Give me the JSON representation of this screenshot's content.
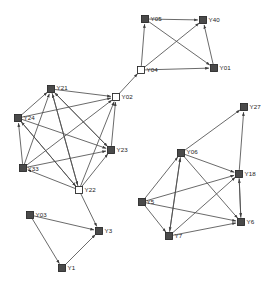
{
  "diagram": {
    "type": "directed-graph",
    "width": 275,
    "height": 287,
    "background_color": "#ffffff",
    "node_fill_color": "#4a4a4a",
    "node_hollow_color": "#ffffff",
    "node_stroke_color": "#2b2b2b",
    "edge_color": "#4f4f4f",
    "label_color": "#1a1a1a",
    "node_size": 7,
    "nodes": [
      {
        "id": "Y05",
        "label": "Y05",
        "x": 145,
        "y": 19,
        "style": "filled",
        "label_dx": 6,
        "label_dy": 2,
        "cluster": "top"
      },
      {
        "id": "Y40",
        "label": "Y40",
        "x": 203,
        "y": 20,
        "style": "filled",
        "label_dx": 6,
        "label_dy": 2,
        "cluster": "top"
      },
      {
        "id": "Y04",
        "label": "Y04",
        "x": 141,
        "y": 70,
        "style": "hollow",
        "label_dx": 6,
        "label_dy": 2,
        "cluster": "top"
      },
      {
        "id": "Y01",
        "label": "Y01",
        "x": 214,
        "y": 68,
        "style": "filled",
        "label_dx": 6,
        "label_dy": 2,
        "cluster": "top"
      },
      {
        "id": "Y21",
        "label": "Y21",
        "x": 51,
        "y": 89,
        "style": "filled",
        "label_dx": 6,
        "label_dy": 1,
        "cluster": "left"
      },
      {
        "id": "Y02",
        "label": "Y02",
        "x": 116,
        "y": 97,
        "style": "hollow",
        "label_dx": 6,
        "label_dy": 2,
        "cluster": "left"
      },
      {
        "id": "Y24",
        "label": "Y24",
        "x": 18,
        "y": 118,
        "style": "filled",
        "label_dx": 6,
        "label_dy": 2,
        "cluster": "left"
      },
      {
        "id": "Y23",
        "label": "Y23",
        "x": 111,
        "y": 150,
        "style": "filled",
        "label_dx": 6,
        "label_dy": 2,
        "cluster": "left"
      },
      {
        "id": "Y33",
        "label": "Y33",
        "x": 23,
        "y": 168,
        "style": "filled",
        "label_dx": 5,
        "label_dy": 3,
        "cluster": "left"
      },
      {
        "id": "Y22",
        "label": "Y22",
        "x": 79,
        "y": 190,
        "style": "hollow",
        "label_dx": 6,
        "label_dy": 2,
        "cluster": "left"
      },
      {
        "id": "Y03",
        "label": "Y03",
        "x": 30,
        "y": 215,
        "style": "filled",
        "label_dx": 6,
        "label_dy": 2,
        "cluster": "bottom"
      },
      {
        "id": "Y3",
        "label": "Y3",
        "x": 99,
        "y": 231,
        "style": "filled",
        "label_dx": 6,
        "label_dy": 2,
        "cluster": "bottom"
      },
      {
        "id": "Y1",
        "label": "Y1",
        "x": 62,
        "y": 268,
        "style": "filled",
        "label_dx": 6,
        "label_dy": 2,
        "cluster": "bottom"
      },
      {
        "id": "Y27",
        "label": "Y27",
        "x": 244,
        "y": 107,
        "style": "filled",
        "label_dx": 6,
        "label_dy": 2,
        "cluster": "right"
      },
      {
        "id": "Y06",
        "label": "Y06",
        "x": 181,
        "y": 153,
        "style": "filled",
        "label_dx": 6,
        "label_dy": 1,
        "cluster": "right"
      },
      {
        "id": "Y18",
        "label": "Y18",
        "x": 239,
        "y": 174,
        "style": "filled",
        "label_dx": 6,
        "label_dy": 2,
        "cluster": "right"
      },
      {
        "id": "Y5",
        "label": "Y5",
        "x": 142,
        "y": 202,
        "style": "filled",
        "label_dx": 5,
        "label_dy": 2,
        "cluster": "right"
      },
      {
        "id": "Y6",
        "label": "Y6",
        "x": 241,
        "y": 222,
        "style": "filled",
        "label_dx": 6,
        "label_dy": 2,
        "cluster": "right"
      },
      {
        "id": "Y7",
        "label": "Y7",
        "x": 169,
        "y": 236,
        "style": "filled",
        "label_dx": 6,
        "label_dy": 2,
        "cluster": "right"
      }
    ],
    "edges": [
      {
        "from": "Y05",
        "to": "Y40"
      },
      {
        "from": "Y05",
        "to": "Y01"
      },
      {
        "from": "Y04",
        "to": "Y05"
      },
      {
        "from": "Y04",
        "to": "Y40"
      },
      {
        "from": "Y04",
        "to": "Y01"
      },
      {
        "from": "Y01",
        "to": "Y40"
      },
      {
        "from": "Y02",
        "to": "Y04"
      },
      {
        "from": "Y21",
        "to": "Y02"
      },
      {
        "from": "Y24",
        "to": "Y21"
      },
      {
        "from": "Y24",
        "to": "Y02"
      },
      {
        "from": "Y24",
        "to": "Y23"
      },
      {
        "from": "Y33",
        "to": "Y21"
      },
      {
        "from": "Y33",
        "to": "Y24"
      },
      {
        "from": "Y33",
        "to": "Y02"
      },
      {
        "from": "Y33",
        "to": "Y23"
      },
      {
        "from": "Y23",
        "to": "Y21"
      },
      {
        "from": "Y23",
        "to": "Y02"
      },
      {
        "from": "Y22",
        "to": "Y21"
      },
      {
        "from": "Y22",
        "to": "Y24"
      },
      {
        "from": "Y22",
        "to": "Y02"
      },
      {
        "from": "Y22",
        "to": "Y23"
      },
      {
        "from": "Y22",
        "to": "Y33"
      },
      {
        "from": "Y21",
        "to": "Y23"
      },
      {
        "from": "Y24",
        "to": "Y22"
      },
      {
        "from": "Y21",
        "to": "Y22"
      },
      {
        "from": "Y22",
        "to": "Y3"
      },
      {
        "from": "Y03",
        "to": "Y3"
      },
      {
        "from": "Y03",
        "to": "Y1"
      },
      {
        "from": "Y1",
        "to": "Y3"
      },
      {
        "from": "Y06",
        "to": "Y27"
      },
      {
        "from": "Y18",
        "to": "Y27"
      },
      {
        "from": "Y06",
        "to": "Y18"
      },
      {
        "from": "Y06",
        "to": "Y6"
      },
      {
        "from": "Y06",
        "to": "Y7"
      },
      {
        "from": "Y5",
        "to": "Y06"
      },
      {
        "from": "Y5",
        "to": "Y18"
      },
      {
        "from": "Y5",
        "to": "Y6"
      },
      {
        "from": "Y5",
        "to": "Y7"
      },
      {
        "from": "Y7",
        "to": "Y06"
      },
      {
        "from": "Y7",
        "to": "Y18"
      },
      {
        "from": "Y7",
        "to": "Y6"
      },
      {
        "from": "Y6",
        "to": "Y18"
      },
      {
        "from": "Y18",
        "to": "Y6"
      }
    ]
  }
}
